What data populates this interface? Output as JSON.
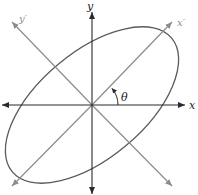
{
  "diagram": {
    "labels": {
      "x": "x",
      "y": "y",
      "x_prime": "x′",
      "y_prime": "y′",
      "angle": "θ"
    },
    "rotation_angle_deg": 40,
    "colors": {
      "main_axes": "#2a2a2a",
      "rotated_axes": "#8c8c8c",
      "ellipse": "#5a5a5a",
      "label_main": "#222222",
      "label_rotated": "#8c8c8c"
    }
  }
}
